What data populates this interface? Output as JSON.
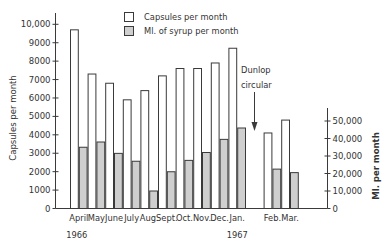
{
  "chart_data": {
    "type": "bar",
    "title": "",
    "categories": [
      "April",
      "May",
      "June",
      "July",
      "Aug.",
      "Sept.",
      "Oct.",
      "Nov.",
      "Dec.",
      "Jan.",
      "Feb.",
      "Mar."
    ],
    "category_years": [
      {
        "label": "1966",
        "under": "April"
      },
      {
        "label": "1967",
        "under": "Jan."
      }
    ],
    "series": [
      {
        "name": "Capsules per month",
        "axis": "left",
        "fill": "#ffffff",
        "values": [
          9700,
          7300,
          6800,
          5900,
          6400,
          7200,
          7600,
          7600,
          7900,
          8700,
          4100,
          4800
        ]
      },
      {
        "name": "Ml. of syrup per month",
        "axis": "right",
        "fill": "#cfcfcf",
        "values": [
          35000,
          38000,
          31500,
          27000,
          10000,
          21000,
          27500,
          32000,
          39500,
          46000,
          22500,
          20500
        ]
      }
    ],
    "left_axis": {
      "label": "Capsules per month",
      "ylim": [
        0,
        10000
      ],
      "ticks": [
        "0",
        "1000",
        "2000",
        "3000",
        "4000",
        "5000",
        "6000",
        "7000",
        "8000",
        "9000",
        "10,000"
      ]
    },
    "right_axis": {
      "label": "Ml. per month",
      "ylim": [
        0,
        50000
      ],
      "ticks": [
        "0",
        "10,000",
        "20,000",
        "30,000",
        "40,000",
        "50,000"
      ]
    },
    "xlabel": "",
    "ylabel": "Capsules per month",
    "y2label": "Ml. per month",
    "grid": false,
    "legend_position": "top",
    "annotations": [
      {
        "text_lines": [
          "Dunlop",
          "circular"
        ],
        "position": "between Jan. and Feb.",
        "arrow": "down"
      }
    ],
    "gap_after_category": "Jan."
  },
  "legend": {
    "items": [
      {
        "label": "Capsules per month"
      },
      {
        "label": "Ml. of syrup per month"
      }
    ]
  },
  "annotation": {
    "line1": "Dunlop",
    "line2": "circular"
  },
  "colors": {
    "ink": "#3a3a3a",
    "syrup_fill": "#cfcfcf",
    "capsule_fill": "#ffffff"
  }
}
